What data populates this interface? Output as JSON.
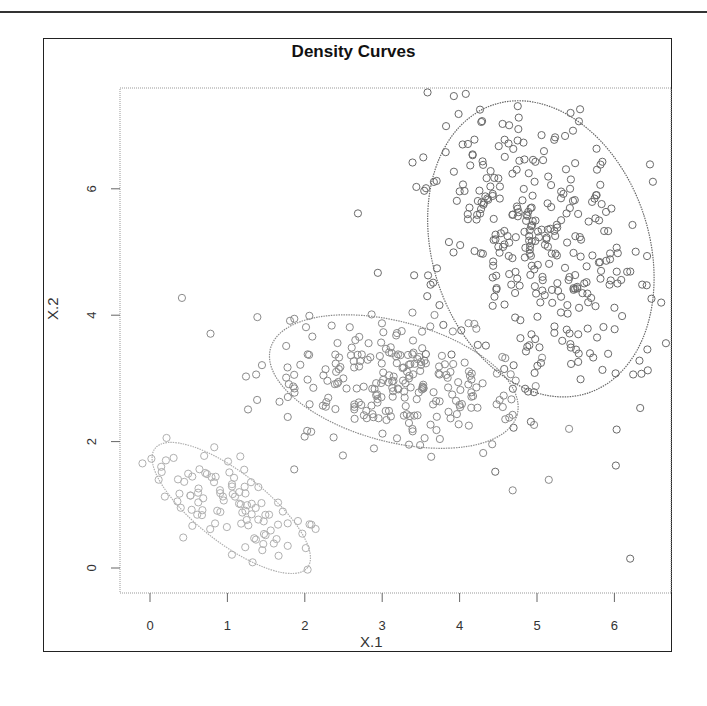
{
  "chart_data": {
    "type": "scatter",
    "title": "Density Curves",
    "xlabel": "X.1",
    "ylabel": "X.2",
    "xlim": [
      -0.4,
      6.8
    ],
    "ylim": [
      -0.4,
      7.6
    ],
    "xticks": [
      0,
      1,
      2,
      3,
      4,
      5,
      6
    ],
    "yticks": [
      0,
      2,
      4,
      6
    ],
    "grid": false,
    "legend": null,
    "series": [
      {
        "name": "cluster-1",
        "color": "#b0b0b0",
        "center": [
          1.0,
          1.0
        ],
        "n_approx": 100,
        "ellipse": {
          "cx": 1.05,
          "cy": 0.95,
          "rx": 1.25,
          "ry": 0.55,
          "angle_deg": -38
        }
      },
      {
        "name": "cluster-2",
        "color": "#8a8a8a",
        "center": [
          3.1,
          3.0
        ],
        "n_approx": 250,
        "ellipse": {
          "cx": 3.15,
          "cy": 2.95,
          "rx": 1.65,
          "ry": 0.95,
          "angle_deg": -15
        }
      },
      {
        "name": "cluster-3",
        "color": "#6a6a6a",
        "center": [
          5.0,
          5.0
        ],
        "n_approx": 350,
        "ellipse": {
          "cx": 5.05,
          "cy": 5.05,
          "rx": 1.4,
          "ry": 2.4,
          "angle_deg": 18
        }
      }
    ]
  },
  "labels": {
    "title": "Density Curves",
    "xlabel": "X.1",
    "ylabel": "X.2",
    "xticks": [
      "0",
      "1",
      "2",
      "3",
      "4",
      "5",
      "6"
    ],
    "yticks": [
      "0",
      "2",
      "4",
      "6"
    ]
  }
}
